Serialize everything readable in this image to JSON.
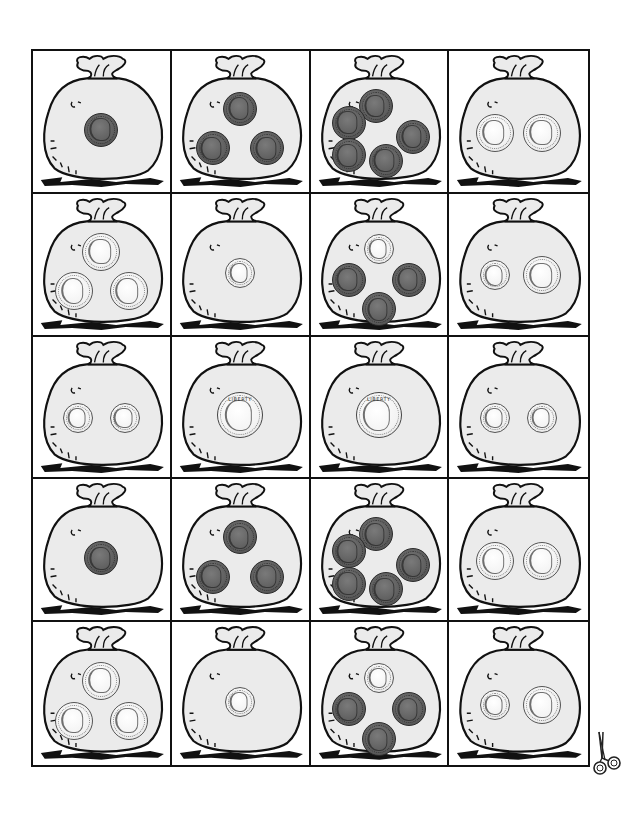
{
  "worksheet": {
    "layout": {
      "columns": 4,
      "rows": 5
    },
    "cut_marker_icon": "scissors-icon",
    "colors": {
      "line": "#111111",
      "bag_fill": "#ebebeb",
      "penny": "#5d5d5d",
      "silver": "#f2f2f2"
    },
    "quarter_legend": "LIBERTY",
    "cards": [
      {
        "row": 1,
        "col": 1,
        "coins": [
          "penny"
        ]
      },
      {
        "row": 1,
        "col": 2,
        "coins": [
          "penny",
          "penny",
          "penny"
        ]
      },
      {
        "row": 1,
        "col": 3,
        "coins": [
          "penny",
          "penny",
          "penny",
          "penny",
          "penny"
        ]
      },
      {
        "row": 1,
        "col": 4,
        "coins": [
          "nickel",
          "nickel"
        ]
      },
      {
        "row": 2,
        "col": 1,
        "coins": [
          "nickel",
          "nickel",
          "nickel"
        ]
      },
      {
        "row": 2,
        "col": 2,
        "coins": [
          "dime"
        ]
      },
      {
        "row": 2,
        "col": 3,
        "coins": [
          "dime",
          "penny",
          "penny",
          "penny"
        ]
      },
      {
        "row": 2,
        "col": 4,
        "coins": [
          "dime",
          "nickel"
        ]
      },
      {
        "row": 3,
        "col": 1,
        "coins": [
          "dime",
          "dime"
        ]
      },
      {
        "row": 3,
        "col": 2,
        "coins": [
          "quarter"
        ]
      },
      {
        "row": 3,
        "col": 3,
        "coins": [
          "quarter"
        ]
      },
      {
        "row": 3,
        "col": 4,
        "coins": [
          "dime",
          "dime"
        ]
      },
      {
        "row": 4,
        "col": 1,
        "coins": [
          "penny"
        ]
      },
      {
        "row": 4,
        "col": 2,
        "coins": [
          "penny",
          "penny",
          "penny"
        ]
      },
      {
        "row": 4,
        "col": 3,
        "coins": [
          "penny",
          "penny",
          "penny",
          "penny",
          "penny"
        ]
      },
      {
        "row": 4,
        "col": 4,
        "coins": [
          "nickel",
          "nickel"
        ]
      },
      {
        "row": 5,
        "col": 1,
        "coins": [
          "nickel",
          "nickel",
          "nickel"
        ]
      },
      {
        "row": 5,
        "col": 2,
        "coins": [
          "dime"
        ]
      },
      {
        "row": 5,
        "col": 3,
        "coins": [
          "dime",
          "penny",
          "penny",
          "penny"
        ]
      },
      {
        "row": 5,
        "col": 4,
        "coins": [
          "dime",
          "nickel"
        ]
      }
    ]
  }
}
